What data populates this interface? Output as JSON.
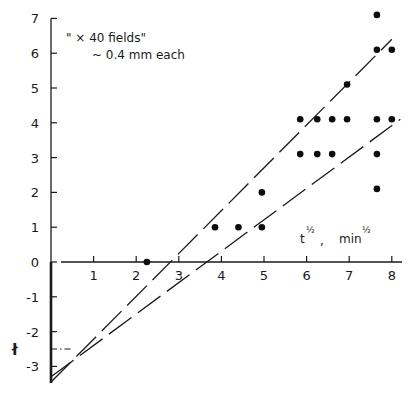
{
  "chart_data": {
    "type": "scatter",
    "title": "",
    "annotation": {
      "line1": "\" × 40 fields\"",
      "line2": "~ 0.4 mm each"
    },
    "xlabel": "t½ ,   min½",
    "xlabel_parts": {
      "var": "t",
      "unit": "min",
      "exp": "½",
      "sep": ","
    },
    "ylabel": "ł",
    "xlim": [
      0,
      8.2
    ],
    "ylim": [
      -3.5,
      7
    ],
    "x_ticks": [
      1,
      2,
      3,
      4,
      5,
      6,
      7,
      8
    ],
    "y_ticks": [
      7,
      6,
      5,
      4,
      3,
      2,
      1,
      0,
      -1,
      -2,
      -3
    ],
    "grid": false,
    "legend": null,
    "points": [
      {
        "x": 2.25,
        "y": 0.0
      },
      {
        "x": 3.85,
        "y": 1.0
      },
      {
        "x": 4.4,
        "y": 1.0
      },
      {
        "x": 4.95,
        "y": 1.0
      },
      {
        "x": 4.95,
        "y": 2.0
      },
      {
        "x": 5.85,
        "y": 3.1
      },
      {
        "x": 6.25,
        "y": 3.1
      },
      {
        "x": 6.6,
        "y": 3.1
      },
      {
        "x": 5.85,
        "y": 4.1
      },
      {
        "x": 6.25,
        "y": 4.1
      },
      {
        "x": 6.6,
        "y": 4.1
      },
      {
        "x": 6.95,
        "y": 4.1
      },
      {
        "x": 7.65,
        "y": 4.1
      },
      {
        "x": 8.0,
        "y": 4.1
      },
      {
        "x": 7.65,
        "y": 3.1
      },
      {
        "x": 7.65,
        "y": 2.1
      },
      {
        "x": 6.95,
        "y": 5.1
      },
      {
        "x": 7.65,
        "y": 6.1
      },
      {
        "x": 8.0,
        "y": 6.1
      },
      {
        "x": 7.65,
        "y": 7.1
      }
    ],
    "lines": [
      {
        "name": "steep-fit",
        "style": "long-dash",
        "x0": 0,
        "y0": -3.45,
        "x1": 8.0,
        "y1": 6.4
      },
      {
        "name": "shallow-fit",
        "style": "long-dash",
        "x0": 0,
        "y0": -3.3,
        "x1": 8.2,
        "y1": 4.1
      }
    ],
    "reference_line": {
      "style": "dash-dot",
      "y": -2.5,
      "x0": 0,
      "x1": 0.5
    }
  }
}
